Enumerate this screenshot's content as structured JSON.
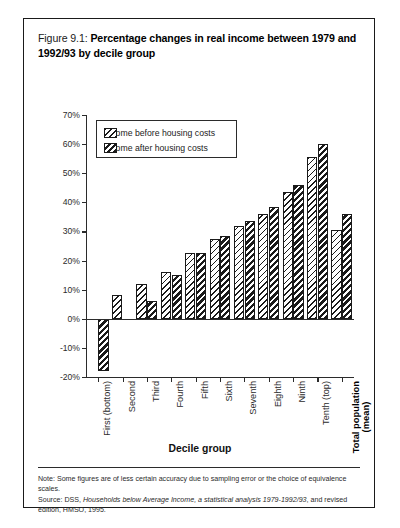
{
  "figure": {
    "label": "Figure 9.1:",
    "title": "Percentage changes in real income between 1979 and 1992/93 by decile group"
  },
  "legend": {
    "items": [
      {
        "label": "Income before housing costs",
        "pattern": "light-hatch",
        "color": "#1a1a1a"
      },
      {
        "label": "Income after housing costs",
        "pattern": "dark-hatch",
        "color": "#1a1a1a"
      }
    ]
  },
  "axes": {
    "y_ticks": [
      "70%",
      "60%",
      "50%",
      "40%",
      "30%",
      "20%",
      "10%",
      "0%",
      "-10%",
      "-20%"
    ],
    "x_title": "Decile group"
  },
  "footnote": {
    "note": "Note: Some figures are of less certain accuracy due to sampling error or the choice of equivalence scales.",
    "source_prefix": "Source: DSS, ",
    "source_italic": "Households below Average Income, a statistical analysis 1979-1992/93",
    "source_suffix": ", and revised edition, HMSO, 1995."
  },
  "chart_data": {
    "type": "bar",
    "title": "Percentage changes in real income between 1979 and 1992/93 by decile group",
    "xlabel": "Decile group",
    "ylabel": "",
    "ylim": [
      -20,
      70
    ],
    "ytick_step": 10,
    "grid": false,
    "legend_position": "top-left-inside",
    "categories": [
      "First (bottom)",
      "Second",
      "Third",
      "Fourth",
      "Fifth",
      "Sixth",
      "Seventh",
      "Eighth",
      "Ninth",
      "Tenth (top)",
      "Total population (mean)"
    ],
    "category_lines": [
      [
        "First (bottom)"
      ],
      [
        "Second"
      ],
      [
        "Third"
      ],
      [
        "Fourth"
      ],
      [
        "Fifth"
      ],
      [
        "Sixth"
      ],
      [
        "Seventh"
      ],
      [
        "Eighth"
      ],
      [
        "Ninth"
      ],
      [
        "Tenth (top)"
      ],
      [
        "Total population",
        "(mean)"
      ]
    ],
    "category_bold": [
      false,
      false,
      false,
      false,
      false,
      false,
      false,
      false,
      false,
      false,
      true
    ],
    "series": [
      {
        "name": "Income before housing costs",
        "values": [
          null,
          8,
          12,
          16,
          22.5,
          27.5,
          32,
          36,
          43.5,
          55.5,
          30.5
        ]
      },
      {
        "name": "Income after housing costs",
        "values": [
          -18,
          null,
          6,
          15,
          22.5,
          28.5,
          33.5,
          38.5,
          46,
          60,
          36
        ]
      }
    ]
  }
}
